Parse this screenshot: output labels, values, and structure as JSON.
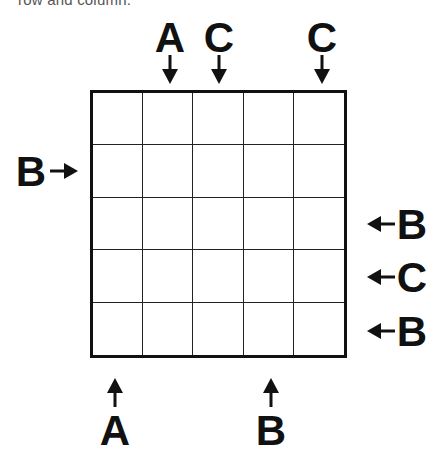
{
  "instruction_text_cropped": "row and column.",
  "grid": {
    "rows": 5,
    "cols": 5,
    "cells": [
      [
        "",
        "",
        "",
        "",
        ""
      ],
      [
        "",
        "",
        "",
        "",
        ""
      ],
      [
        "",
        "",
        "",
        "",
        ""
      ],
      [
        "",
        "",
        "",
        "",
        ""
      ],
      [
        "",
        "",
        "",
        "",
        ""
      ]
    ]
  },
  "clues": {
    "top": [
      {
        "col": 2,
        "letter": "A"
      },
      {
        "col": 3,
        "letter": "C"
      },
      {
        "col": 5,
        "letter": "C"
      }
    ],
    "left": [
      {
        "row": 2,
        "letter": "B"
      }
    ],
    "right": [
      {
        "row": 3,
        "letter": "B"
      },
      {
        "row": 4,
        "letter": "C"
      },
      {
        "row": 5,
        "letter": "B"
      }
    ],
    "bottom": [
      {
        "col": 1,
        "letter": "A"
      },
      {
        "col": 4,
        "letter": "B"
      }
    ]
  },
  "colors": {
    "ink": "#111111",
    "background": "#ffffff"
  }
}
